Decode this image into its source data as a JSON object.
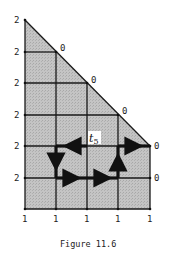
{
  "figure": {
    "caption": "Figure 11.6",
    "region_label": "t",
    "region_label_sub": "5",
    "fill_color": "#bdbdbd",
    "line_color": "#1a1a1a",
    "left_labels": [
      "2",
      "2",
      "2",
      "2",
      "2",
      "2"
    ],
    "bottom_labels": [
      "1",
      "1",
      "1",
      "1",
      "1"
    ],
    "diagonal_labels": [
      "0",
      "0",
      "0",
      "0"
    ],
    "right_labels": [
      "0"
    ]
  }
}
